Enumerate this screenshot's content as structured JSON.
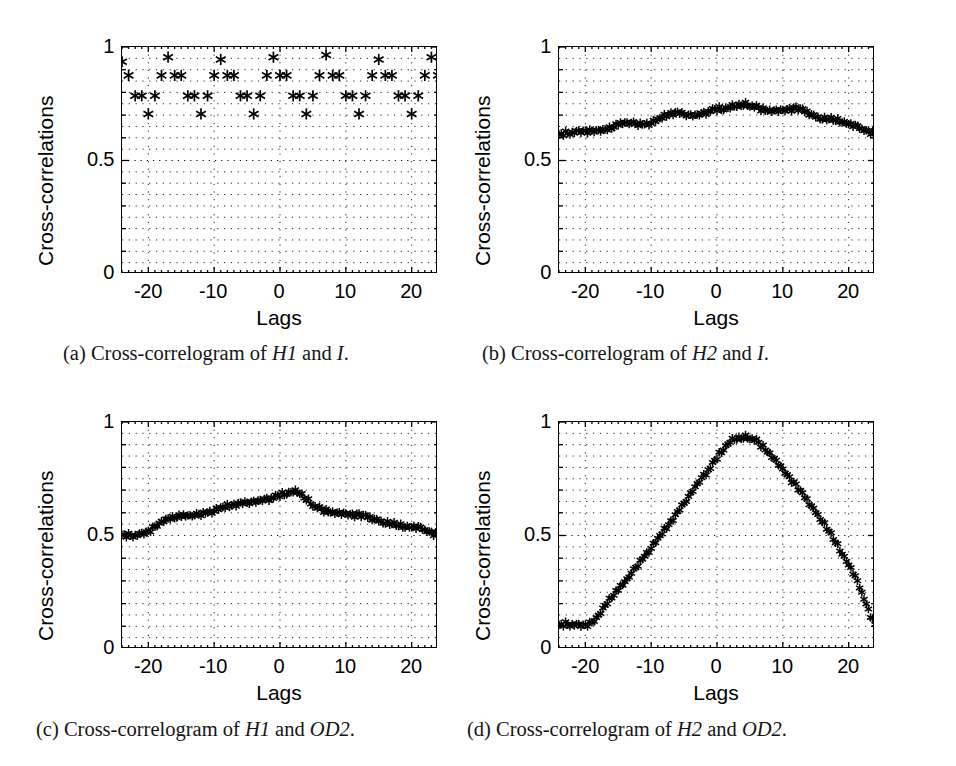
{
  "figure": {
    "panel_count": 4,
    "common": {
      "ylabel": "Cross-correlations",
      "xlabel": "Lags",
      "yticks": [
        "0",
        "0.5",
        "1"
      ],
      "ytick_values": [
        0,
        0.5,
        1
      ],
      "xticks": [
        "-20",
        "-10",
        "0",
        "10",
        "20"
      ],
      "xtick_values": [
        -20,
        -10,
        0,
        10,
        20
      ],
      "marker": "asterisk",
      "grid": "dotted",
      "axis_color": "#000000",
      "marker_color": "#000000"
    }
  },
  "panels": [
    {
      "id": "a",
      "caption_tag": "(a)",
      "caption_pre": "Cross-correlogram of ",
      "caption_var1": "H1",
      "caption_mid": " and ",
      "caption_var2": "I",
      "caption_post": ".",
      "caption_plain": "(a) Cross-correlogram of H1 and I."
    },
    {
      "id": "b",
      "caption_tag": "(b)",
      "caption_pre": "Cross-correlogram of ",
      "caption_var1": "H2",
      "caption_mid": " and ",
      "caption_var2": "I",
      "caption_post": ".",
      "caption_plain": "(b) Cross-correlogram of H2 and I."
    },
    {
      "id": "c",
      "caption_tag": "(c)",
      "caption_pre": "Cross-correlogram of ",
      "caption_var1": "H1",
      "caption_mid": " and ",
      "caption_var2": "OD2",
      "caption_post": ".",
      "caption_plain": "(c) Cross-correlogram of H1 and OD2."
    },
    {
      "id": "d",
      "caption_tag": "(d)",
      "caption_pre": "Cross-correlogram of ",
      "caption_var1": "H2",
      "caption_mid": " and ",
      "caption_var2": "OD2",
      "caption_post": ".",
      "caption_plain": "(d) Cross-correlogram of H2 and OD2."
    }
  ],
  "chart_data": [
    {
      "panel": "a",
      "type": "scatter",
      "title": "Cross-correlogram of H1 and I",
      "xlabel": "Lags",
      "ylabel": "Cross-correlations",
      "xlim": [
        -24,
        24
      ],
      "ylim": [
        0,
        1
      ],
      "xticks": [
        -20,
        -10,
        0,
        10,
        20
      ],
      "yticks": [
        0,
        0.5,
        1
      ],
      "grid": true,
      "legend": null,
      "marker": "*",
      "x": [
        -24,
        -23,
        -22,
        -21,
        -20,
        -19,
        -18,
        -17,
        -16,
        -15,
        -14,
        -13,
        -12,
        -11,
        -10,
        -9,
        -8,
        -7,
        -6,
        -5,
        -4,
        -3,
        -2,
        -1,
        0,
        1,
        2,
        3,
        4,
        5,
        6,
        7,
        8,
        9,
        10,
        11,
        12,
        13,
        14,
        15,
        16,
        17,
        18,
        19,
        20,
        21,
        22,
        23,
        24
      ],
      "y": [
        0.935,
        0.875,
        0.785,
        0.785,
        0.705,
        0.785,
        0.875,
        0.955,
        0.875,
        0.875,
        0.785,
        0.785,
        0.705,
        0.785,
        0.875,
        0.945,
        0.875,
        0.875,
        0.785,
        0.785,
        0.705,
        0.785,
        0.875,
        0.955,
        0.875,
        0.875,
        0.785,
        0.785,
        0.705,
        0.785,
        0.875,
        0.965,
        0.875,
        0.875,
        0.785,
        0.785,
        0.705,
        0.785,
        0.875,
        0.945,
        0.875,
        0.875,
        0.785,
        0.785,
        0.705,
        0.785,
        0.875,
        0.955,
        0.875
      ]
    },
    {
      "panel": "b",
      "type": "line",
      "title": "Cross-correlogram of H2 and I",
      "xlabel": "Lags",
      "ylabel": "Cross-correlations",
      "xlim": [
        -24,
        24
      ],
      "ylim": [
        0,
        1
      ],
      "xticks": [
        -20,
        -10,
        0,
        10,
        20
      ],
      "yticks": [
        0,
        0.5,
        1
      ],
      "grid": true,
      "legend": null,
      "marker": "*",
      "x": [
        -24,
        -23,
        -22,
        -21,
        -20,
        -19,
        -18,
        -17,
        -16,
        -15,
        -14,
        -13,
        -12,
        -11,
        -10,
        -9,
        -8,
        -7,
        -6,
        -5,
        -4,
        -3,
        -2,
        -1,
        0,
        1,
        2,
        3,
        4,
        5,
        6,
        7,
        8,
        9,
        10,
        11,
        12,
        13,
        14,
        15,
        16,
        17,
        18,
        19,
        20,
        21,
        22,
        23,
        24
      ],
      "y": [
        0.62,
        0.626,
        0.63,
        0.632,
        0.633,
        0.632,
        0.633,
        0.64,
        0.652,
        0.665,
        0.673,
        0.672,
        0.666,
        0.665,
        0.67,
        0.683,
        0.7,
        0.712,
        0.713,
        0.706,
        0.7,
        0.702,
        0.712,
        0.726,
        0.733,
        0.734,
        0.74,
        0.752,
        0.755,
        0.748,
        0.738,
        0.73,
        0.726,
        0.725,
        0.726,
        0.73,
        0.732,
        0.724,
        0.71,
        0.698,
        0.69,
        0.688,
        0.686,
        0.68,
        0.668,
        0.654,
        0.642,
        0.632,
        0.622
      ]
    },
    {
      "panel": "c",
      "type": "line",
      "title": "Cross-correlogram of H1 and OD2",
      "xlabel": "Lags",
      "ylabel": "Cross-correlations",
      "xlim": [
        -24,
        24
      ],
      "ylim": [
        0,
        1
      ],
      "xticks": [
        -20,
        -10,
        0,
        10,
        20
      ],
      "yticks": [
        0,
        0.5,
        1
      ],
      "grid": true,
      "legend": null,
      "marker": "*",
      "x": [
        -24,
        -23,
        -22,
        -21,
        -20,
        -19,
        -18,
        -17,
        -16,
        -15,
        -14,
        -13,
        -12,
        -11,
        -10,
        -9,
        -8,
        -7,
        -6,
        -5,
        -4,
        -3,
        -2,
        -1,
        0,
        1,
        2,
        3,
        4,
        5,
        6,
        7,
        8,
        9,
        10,
        11,
        12,
        13,
        14,
        15,
        16,
        17,
        18,
        19,
        20,
        21,
        22,
        23,
        24
      ],
      "y": [
        0.508,
        0.506,
        0.507,
        0.512,
        0.522,
        0.54,
        0.562,
        0.578,
        0.588,
        0.592,
        0.594,
        0.596,
        0.6,
        0.606,
        0.614,
        0.624,
        0.634,
        0.64,
        0.644,
        0.646,
        0.65,
        0.656,
        0.664,
        0.674,
        0.684,
        0.692,
        0.7,
        0.698,
        0.668,
        0.638,
        0.622,
        0.614,
        0.608,
        0.604,
        0.6,
        0.596,
        0.592,
        0.586,
        0.578,
        0.57,
        0.562,
        0.556,
        0.552,
        0.548,
        0.544,
        0.538,
        0.528,
        0.516,
        0.506
      ]
    },
    {
      "panel": "d",
      "type": "line",
      "title": "Cross-correlogram of H2 and OD2",
      "xlabel": "Lags",
      "ylabel": "Cross-correlations",
      "xlim": [
        -24,
        24
      ],
      "ylim": [
        0,
        1
      ],
      "xticks": [
        -20,
        -10,
        0,
        10,
        20
      ],
      "yticks": [
        0,
        0.5,
        1
      ],
      "grid": true,
      "legend": null,
      "marker": "*",
      "x": [
        -24,
        -23,
        -22,
        -21,
        -20,
        -19,
        -18,
        -17,
        -16,
        -15,
        -14,
        -13,
        -12,
        -11,
        -10,
        -9,
        -8,
        -7,
        -6,
        -5,
        -4,
        -3,
        -2,
        -1,
        0,
        1,
        2,
        3,
        4,
        5,
        6,
        7,
        8,
        9,
        10,
        11,
        12,
        13,
        14,
        15,
        16,
        17,
        18,
        19,
        20,
        21,
        22,
        23,
        24
      ],
      "y": [
        0.112,
        0.116,
        0.114,
        0.11,
        0.108,
        0.118,
        0.148,
        0.196,
        0.236,
        0.268,
        0.302,
        0.34,
        0.378,
        0.414,
        0.45,
        0.488,
        0.528,
        0.566,
        0.604,
        0.644,
        0.686,
        0.728,
        0.768,
        0.806,
        0.85,
        0.888,
        0.92,
        0.938,
        0.94,
        0.936,
        0.92,
        0.896,
        0.866,
        0.832,
        0.796,
        0.758,
        0.722,
        0.684,
        0.646,
        0.608,
        0.568,
        0.524,
        0.478,
        0.43,
        0.378,
        0.32,
        0.252,
        0.176,
        0.108
      ]
    }
  ]
}
